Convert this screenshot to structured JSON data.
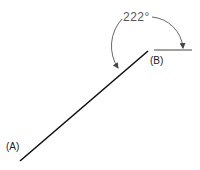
{
  "diagram": {
    "angle_label": "222°",
    "point_a_label": "(A)",
    "point_b_label": "(B)",
    "colors": {
      "line": "#111111",
      "arc": "#555555",
      "reference_line": "#444444",
      "text": "#222222"
    }
  }
}
